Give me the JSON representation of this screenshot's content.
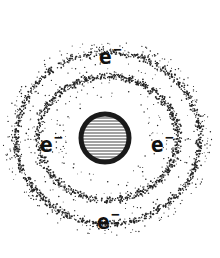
{
  "diagram": {
    "title": "",
    "nucleus": {
      "cx": 105,
      "cy": 138,
      "r": 26,
      "stroke": "#1a1a1a",
      "fill": "#ffffff",
      "hatch_color": "#444444"
    },
    "cloud": {
      "cx": 108,
      "cy": 138,
      "inner_shell_rx": 70,
      "inner_shell_ry": 62,
      "outer_shell_rx": 92,
      "outer_shell_ry": 86,
      "dot_color": "#222222"
    },
    "electrons": [
      {
        "label": "e",
        "charge": "−",
        "position": "top",
        "x": 99,
        "y": 40
      },
      {
        "label": "e",
        "charge": "−",
        "position": "left",
        "x": 40,
        "y": 128
      },
      {
        "label": "e",
        "charge": "−",
        "position": "right",
        "x": 151,
        "y": 128
      },
      {
        "label": "e",
        "charge": "−",
        "position": "bottom",
        "x": 97,
        "y": 205
      }
    ]
  }
}
